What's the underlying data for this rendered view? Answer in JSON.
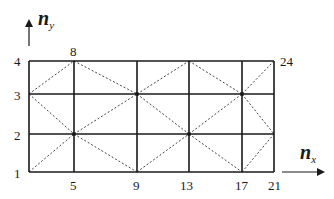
{
  "diagram": {
    "type": "finite-element-mesh",
    "grid": {
      "x_lines": [
        29,
        74,
        137,
        189,
        242,
        274
      ],
      "y_lines": [
        61,
        94,
        134,
        172
      ],
      "line_color": "#1a1a1a",
      "diag_color": "#444444"
    },
    "axes": {
      "x": {
        "symbol": "n",
        "subscript": "x"
      },
      "y": {
        "symbol": "n",
        "subscript": "y"
      }
    },
    "node_labels": [
      {
        "text": "1",
        "x": 14,
        "y": 167
      },
      {
        "text": "2",
        "x": 14,
        "y": 129
      },
      {
        "text": "3",
        "x": 14,
        "y": 89
      },
      {
        "text": "4",
        "x": 14,
        "y": 55
      },
      {
        "text": "5",
        "x": 70,
        "y": 179
      },
      {
        "text": "8",
        "x": 70,
        "y": 45
      },
      {
        "text": "9",
        "x": 133,
        "y": 179
      },
      {
        "text": "13",
        "x": 180,
        "y": 179
      },
      {
        "text": "17",
        "x": 235,
        "y": 179
      },
      {
        "text": "21",
        "x": 268,
        "y": 179
      },
      {
        "text": "24",
        "x": 280,
        "y": 55
      }
    ],
    "diagonals": [
      [
        29,
        94,
        74,
        61
      ],
      [
        74,
        61,
        137,
        94
      ],
      [
        137,
        94,
        189,
        61
      ],
      [
        189,
        61,
        242,
        94
      ],
      [
        242,
        94,
        274,
        61
      ],
      [
        29,
        94,
        74,
        134
      ],
      [
        74,
        134,
        137,
        94
      ],
      [
        137,
        94,
        189,
        134
      ],
      [
        189,
        134,
        242,
        94
      ],
      [
        242,
        94,
        274,
        134
      ],
      [
        29,
        172,
        74,
        134
      ],
      [
        74,
        134,
        137,
        172
      ],
      [
        137,
        172,
        189,
        134
      ],
      [
        189,
        134,
        242,
        172
      ],
      [
        242,
        172,
        274,
        134
      ]
    ],
    "nodes_dotted": [
      [
        74,
        134
      ],
      [
        137,
        94
      ],
      [
        189,
        134
      ],
      [
        242,
        94
      ]
    ]
  }
}
